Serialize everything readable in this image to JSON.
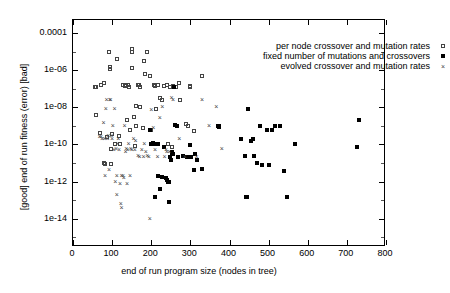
{
  "chart_data": {
    "type": "scatter",
    "title": "",
    "xlabel": "end of run program size (nodes in tree)",
    "ylabel": "[good]  end of run fitness (error)  [bad]",
    "xlim": [
      0,
      800
    ],
    "ylim": [
      3e-16,
      0.0005
    ],
    "yscale": "log",
    "xscale": "linear",
    "grid": false,
    "legend_position": "top-right",
    "xticks": [
      0,
      100,
      200,
      300,
      400,
      500,
      600,
      700,
      800
    ],
    "xticklabels": [
      "0",
      "100",
      "200",
      "300",
      "400",
      "500",
      "600",
      "700",
      "800"
    ],
    "yticks": [
      0.0001,
      1e-06,
      1e-08,
      1e-10,
      1e-12,
      1e-14
    ],
    "yticklabels": [
      "0.0001",
      "1e-06",
      "1e-08",
      "1e-10",
      "1e-12",
      "1e-14"
    ],
    "series": [
      {
        "name": "per node crossover and mutation rates",
        "marker": "open-square",
        "color": "#444444",
        "points": [
          [
            55,
            1.2e-07
          ],
          [
            60,
            1.3e-07
          ],
          [
            58,
            4e-09
          ],
          [
            72,
            1.6e-07
          ],
          [
            78,
            2e-07
          ],
          [
            70,
            4e-10
          ],
          [
            80,
            1e-11
          ],
          [
            82,
            9e-12
          ],
          [
            88,
            2.5e-10
          ],
          [
            92,
            1e-05
          ],
          [
            95,
            1.4e-06
          ],
          [
            95,
            1.2e-06
          ],
          [
            96,
            9e-12
          ],
          [
            98,
            6e-11
          ],
          [
            100,
            3.5e-10
          ],
          [
            108,
            1e-10
          ],
          [
            112,
            4e-06
          ],
          [
            118,
            3e-10
          ],
          [
            120,
            1e-10
          ],
          [
            128,
            1.5e-07
          ],
          [
            132,
            1.4e-07
          ],
          [
            136,
            1.5e-07
          ],
          [
            138,
            2e-09
          ],
          [
            140,
            1.5e-07
          ],
          [
            142,
            1.2e-07
          ],
          [
            146,
            6e-10
          ],
          [
            150,
            1.3e-05
          ],
          [
            152,
            9e-06
          ],
          [
            152,
            1.3e-06
          ],
          [
            156,
            3e-09
          ],
          [
            158,
            8e-11
          ],
          [
            160,
            1.2e-08
          ],
          [
            162,
            1e-09
          ],
          [
            166,
            1.5e-07
          ],
          [
            168,
            1.5e-07
          ],
          [
            170,
            1.2e-07
          ],
          [
            172,
            1.1e-08
          ],
          [
            178,
            8e-10
          ],
          [
            182,
            3e-06
          ],
          [
            185,
            6e-07
          ],
          [
            190,
            1e-05
          ],
          [
            196,
            5e-07
          ],
          [
            200,
            6e-10
          ],
          [
            208,
            1.5e-07
          ],
          [
            210,
            1.4e-07
          ],
          [
            212,
            8e-09
          ],
          [
            218,
            1.5e-07
          ],
          [
            222,
            3e-08
          ],
          [
            228,
            2.5e-08
          ],
          [
            232,
            1.4e-07
          ],
          [
            240,
            1.5e-07
          ],
          [
            244,
            1.1e-10
          ],
          [
            248,
            1.3e-07
          ],
          [
            252,
            7e-11
          ],
          [
            256,
            1.4e-07
          ],
          [
            262,
            1.2e-07
          ],
          [
            270,
            2e-07
          ],
          [
            274,
            2.5e-08
          ],
          [
            290,
            1.2e-09
          ],
          [
            295,
            1e-09
          ],
          [
            298,
            1.4e-07
          ],
          [
            300,
            1.3e-07
          ],
          [
            308,
            5e-10
          ],
          [
            330,
            5e-07
          ]
        ]
      },
      {
        "name": "fixed number of mutations and crossovers",
        "marker": "filled-square",
        "color": "#000000",
        "points": [
          [
            196,
            6e-10
          ],
          [
            200,
            1e-10
          ],
          [
            205,
            1.2e-10
          ],
          [
            206,
            1.1e-10
          ],
          [
            210,
            1.4e-13
          ],
          [
            216,
            1e-10
          ],
          [
            218,
            2e-12
          ],
          [
            222,
            4e-13
          ],
          [
            228,
            1.8e-12
          ],
          [
            232,
            7e-11
          ],
          [
            238,
            1.5e-12
          ],
          [
            240,
            1.2e-12
          ],
          [
            244,
            1e-12
          ],
          [
            245,
            1e-12
          ],
          [
            246,
            8e-14
          ],
          [
            248,
            2e-11
          ],
          [
            250,
            1.5e-11
          ],
          [
            252,
            4e-11
          ],
          [
            254,
            3.5e-11
          ],
          [
            256,
            3e-11
          ],
          [
            258,
            1.3e-07
          ],
          [
            260,
            1.1e-09
          ],
          [
            266,
            1e-09
          ],
          [
            268,
            2e-11
          ],
          [
            280,
            2.5e-11
          ],
          [
            292,
            2e-11
          ],
          [
            300,
            9e-11
          ],
          [
            302,
            2e-11
          ],
          [
            308,
            4e-12
          ],
          [
            312,
            3e-11
          ],
          [
            318,
            1.5e-11
          ],
          [
            330,
            5e-12
          ],
          [
            370,
            1e-09
          ],
          [
            372,
            1e-09
          ],
          [
            374,
            9e-10
          ],
          [
            430,
            2e-10
          ],
          [
            440,
            2.5e-11
          ],
          [
            442,
            1.5e-13
          ],
          [
            446,
            1.5e-13
          ],
          [
            448,
            8e-09
          ],
          [
            455,
            1.5e-10
          ],
          [
            460,
            2e-10
          ],
          [
            462,
            2.5e-11
          ],
          [
            470,
            1e-11
          ],
          [
            478,
            1e-09
          ],
          [
            484,
            8e-12
          ],
          [
            496,
            6e-10
          ],
          [
            500,
            8e-12
          ],
          [
            508,
            6e-10
          ],
          [
            516,
            1e-09
          ],
          [
            530,
            1e-09
          ],
          [
            540,
            3.5e-12
          ],
          [
            548,
            1.5e-13
          ],
          [
            568,
            1e-10
          ],
          [
            726,
            7e-11
          ],
          [
            730,
            2e-09
          ]
        ]
      },
      {
        "name": "evolved crossover and mutation rates",
        "marker": "cross",
        "color": "#444444",
        "points": [
          [
            68,
            2.5e-10
          ],
          [
            72,
            2.5e-10
          ],
          [
            74,
            2e-10
          ],
          [
            78,
            1.5e-09
          ],
          [
            80,
            2e-10
          ],
          [
            82,
            2e-12
          ],
          [
            84,
            8e-09
          ],
          [
            86,
            2.5e-08
          ],
          [
            88,
            2e-10
          ],
          [
            90,
            3e-10
          ],
          [
            92,
            4e-12
          ],
          [
            94,
            2.6e-08
          ],
          [
            96,
            2.5e-08
          ],
          [
            98,
            3e-10
          ],
          [
            100,
            2e-10
          ],
          [
            102,
            1e-09
          ],
          [
            104,
            5e-11
          ],
          [
            106,
            8e-09
          ],
          [
            108,
            1e-12
          ],
          [
            110,
            6e-11
          ],
          [
            112,
            2e-12
          ],
          [
            112,
            2e-13
          ],
          [
            114,
            1e-10
          ],
          [
            116,
            2e-10
          ],
          [
            118,
            5e-11
          ],
          [
            120,
            7e-13
          ],
          [
            122,
            6e-14
          ],
          [
            124,
            2e-12
          ],
          [
            124,
            4e-14
          ],
          [
            128,
            2e-12
          ],
          [
            130,
            1.5e-12
          ],
          [
            132,
            1e-09
          ],
          [
            134,
            4e-11
          ],
          [
            136,
            6e-11
          ],
          [
            138,
            7e-13
          ],
          [
            140,
            5e-11
          ],
          [
            142,
            1e-10
          ],
          [
            146,
            2e-12
          ],
          [
            148,
            6e-11
          ],
          [
            150,
            5e-11
          ],
          [
            155,
            2e-10
          ],
          [
            158,
            5e-11
          ],
          [
            160,
            1.5e-10
          ],
          [
            166,
            2.5e-11
          ],
          [
            170,
            2e-11
          ],
          [
            176,
            5e-11
          ],
          [
            180,
            2e-11
          ],
          [
            182,
            1e-10
          ],
          [
            186,
            4e-11
          ],
          [
            190,
            2.5e-11
          ],
          [
            194,
            2e-11
          ],
          [
            196,
            1e-14
          ],
          [
            200,
            7e-09
          ],
          [
            205,
            8e-10
          ],
          [
            210,
            5e-11
          ],
          [
            216,
            2e-11
          ],
          [
            222,
            2.5e-09
          ],
          [
            228,
            1e-08
          ],
          [
            234,
            2e-11
          ],
          [
            238,
            5e-11
          ],
          [
            240,
            4e-11
          ],
          [
            246,
            4e-11
          ],
          [
            252,
            3e-08
          ],
          [
            256,
            2.4e-08
          ],
          [
            272,
            2e-10
          ],
          [
            286,
            2e-11
          ],
          [
            316,
            2e-11
          ],
          [
            330,
            2.5e-08
          ],
          [
            348,
            1e-09
          ],
          [
            366,
            1e-08
          ],
          [
            380,
            6e-11
          ]
        ]
      }
    ]
  },
  "legend": {
    "items": [
      {
        "label": "per node crossover and mutation rates",
        "marker": "open-square"
      },
      {
        "label": "fixed number of mutations and crossovers",
        "marker": "filled-square"
      },
      {
        "label": "evolved crossover and mutation rates",
        "marker": "cross"
      }
    ]
  }
}
